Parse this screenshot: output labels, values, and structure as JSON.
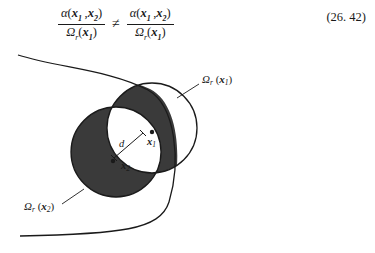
{
  "equation": {
    "left_fraction": {
      "numerator_fn": "α",
      "numerator_args": [
        "x",
        "x"
      ],
      "numerator_subs": [
        "1",
        "2"
      ],
      "denominator_fn": "Ω",
      "denominator_sub": "r",
      "denominator_args": [
        "x"
      ],
      "denominator_arg_subs": [
        "1"
      ]
    },
    "relation": "≠",
    "right_fraction": {
      "numerator_fn": "α",
      "numerator_args": [
        "x",
        "x"
      ],
      "numerator_subs": [
        "1",
        "2"
      ],
      "denominator_fn": "Ω",
      "denominator_sub": "r",
      "denominator_args": [
        "x"
      ],
      "denominator_arg_subs": [
        "1"
      ]
    },
    "number": "(26. 42)"
  },
  "figure": {
    "labels": {
      "circle_x1": {
        "symbol": "Ω",
        "subscript": "r",
        "arg": "x",
        "arg_subscript": "1"
      },
      "circle_x2": {
        "symbol": "Ω",
        "subscript": "r",
        "arg": "x",
        "arg_subscript": "2"
      },
      "distance": "d",
      "point_x1": {
        "name": "x",
        "subscript": "1"
      },
      "point_x2": {
        "name": "x",
        "subscript": "2"
      }
    },
    "colors": {
      "shaded_region": "#3a3a3a",
      "unshaded_region": "#ffffff",
      "stroke": "#1a1a1a"
    },
    "geometry": {
      "circle_x1": {
        "cx": 152,
        "cy": 128,
        "r": 45
      },
      "circle_x2": {
        "cx": 116,
        "cy": 152,
        "r": 45
      },
      "point_x1": {
        "x": 143,
        "y": 133
      },
      "point_x2": {
        "x": 114,
        "y": 158
      }
    }
  }
}
